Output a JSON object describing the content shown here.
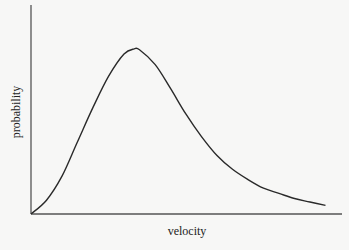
{
  "chart_data": {
    "type": "line",
    "title": "",
    "xlabel": "velocity",
    "ylabel": "probability",
    "grid": false,
    "legend": null,
    "ticks": {
      "x": [],
      "y": []
    },
    "xlim": [
      0,
      10
    ],
    "ylim": [
      0,
      1
    ],
    "series": [
      {
        "name": "velocity distribution",
        "x": [
          0,
          0.5,
          1.0,
          1.5,
          2.0,
          2.5,
          3.0,
          3.33,
          3.5,
          4.0,
          4.5,
          5.0,
          5.5,
          6.0,
          6.5,
          7.0,
          7.5,
          8.0,
          8.5,
          9.0,
          9.5
        ],
        "y": [
          0.0,
          0.08,
          0.22,
          0.42,
          0.62,
          0.8,
          0.93,
          0.96,
          0.955,
          0.87,
          0.73,
          0.58,
          0.45,
          0.34,
          0.26,
          0.2,
          0.15,
          0.12,
          0.09,
          0.07,
          0.05
        ]
      }
    ]
  },
  "labels": {
    "x_axis": "velocity",
    "y_axis": "probability"
  }
}
